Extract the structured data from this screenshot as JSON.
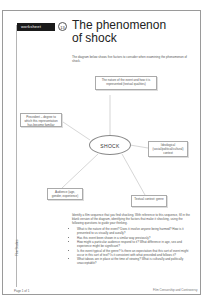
{
  "worksheet": {
    "badge_label": "worksheet",
    "number": "13",
    "title_line1": "The phenomenon",
    "title_line2": "of shock",
    "intro": "The diagram below shows five factors to consider when examining the phenomenon of shock."
  },
  "diagram": {
    "center": "SHOCK",
    "nodes": [
      {
        "id": "top",
        "text": "The nature of the event and how it is represented (textual qualities)"
      },
      {
        "id": "left",
        "text": "Precedent – degree to which this representation has become familiar"
      },
      {
        "id": "right",
        "text": "Ideological (social/political/cultural) context"
      },
      {
        "id": "bottom-left",
        "text": "Audience (age, gender, experience)"
      },
      {
        "id": "bottom-right",
        "text": "Textual context: genre"
      }
    ]
  },
  "instructions": {
    "lead": "Identify a film sequence that you find shocking. With reference to this sequence, fill in the blank version of the diagram, identifying the factors that make it shocking, using the following questions to guide your thinking.",
    "questions": [
      "What is the nature of the event? Does it involve anyone being harmed? How is it presented to us visually and aurally?",
      "Has this event been shown in a similar way previously?",
      "How might a particular audience respond to it? What difference in age, sex and experience might be significant?",
      "Is the event typical of the genre? Is there an expectation that this sort of event might occur in this sort of text? Is it consistent with what preceded and follows it?",
      "What taboos are in place at the time of viewing? What is culturally and politically unacceptable?"
    ]
  },
  "footer": {
    "side_label": "Film Studies",
    "page": "Page 1 of 1",
    "right_text": "Film Censorship and Controversy"
  }
}
